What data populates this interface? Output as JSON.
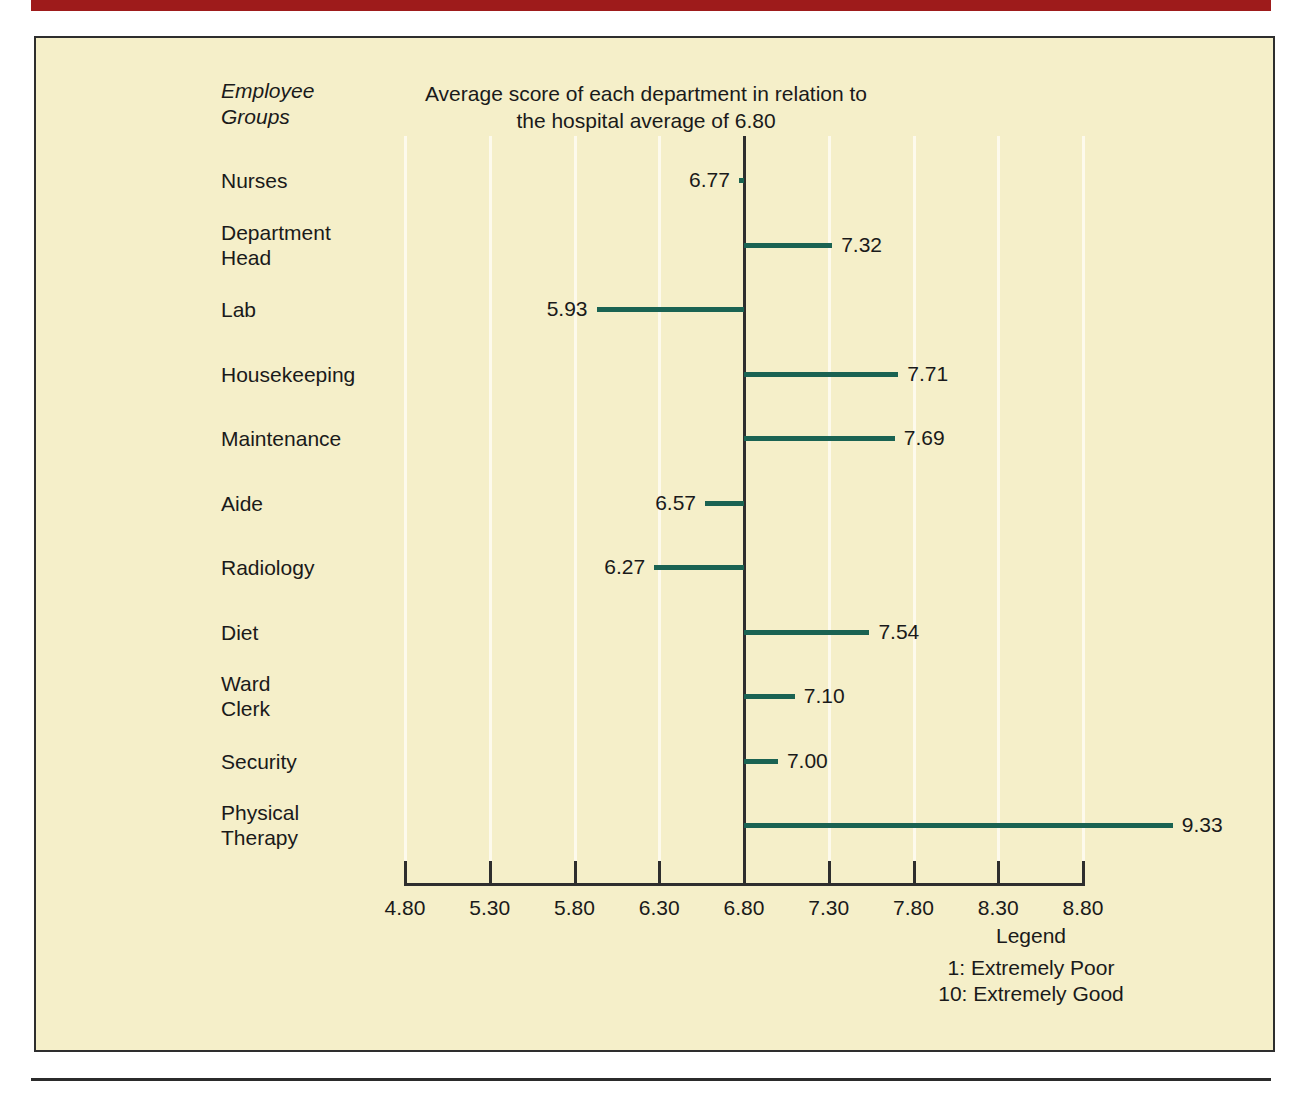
{
  "colors": {
    "top_rule": "#9E1B1B",
    "figure_background": "#F5EFC9",
    "frame": "#2E2E2E",
    "bar": "#1A6352",
    "gridline": "#FDFAEC",
    "text": "#1A1A1A"
  },
  "axis_label": "Employee\nGroups",
  "legend": {
    "title": "Legend",
    "lines": [
      "1: Extremely Poor",
      "10: Extremely Good"
    ]
  },
  "chart_data": {
    "type": "bar",
    "orientation": "horizontal",
    "title": "Average score of each department in relation to\nthe hospital average of 6.80",
    "xlabel": "",
    "ylabel": "Employee Groups",
    "baseline": 6.8,
    "baseline_label": "6.80",
    "xlim": [
      4.8,
      8.8
    ],
    "xticks": [
      4.8,
      5.3,
      5.8,
      6.3,
      6.8,
      7.3,
      7.8,
      8.3,
      8.8
    ],
    "xtick_labels": [
      "4.80",
      "5.30",
      "5.80",
      "6.30",
      "6.80",
      "7.30",
      "7.80",
      "8.30",
      "8.80"
    ],
    "grid": true,
    "legend_position": "bottom-right",
    "categories": [
      "Nurses",
      "Department\nHead",
      "Lab",
      "Housekeeping",
      "Maintenance",
      "Aide",
      "Radiology",
      "Diet",
      "Ward\nClerk",
      "Security",
      "Physical\nTherapy"
    ],
    "values": [
      6.77,
      7.32,
      5.93,
      7.71,
      7.69,
      6.57,
      6.27,
      7.54,
      7.1,
      7.0,
      9.33
    ],
    "value_labels": [
      "6.77",
      "7.32",
      "5.93",
      "7.71",
      "7.69",
      "6.57",
      "6.27",
      "7.54",
      "7.10",
      "7.00",
      "9.33"
    ]
  }
}
